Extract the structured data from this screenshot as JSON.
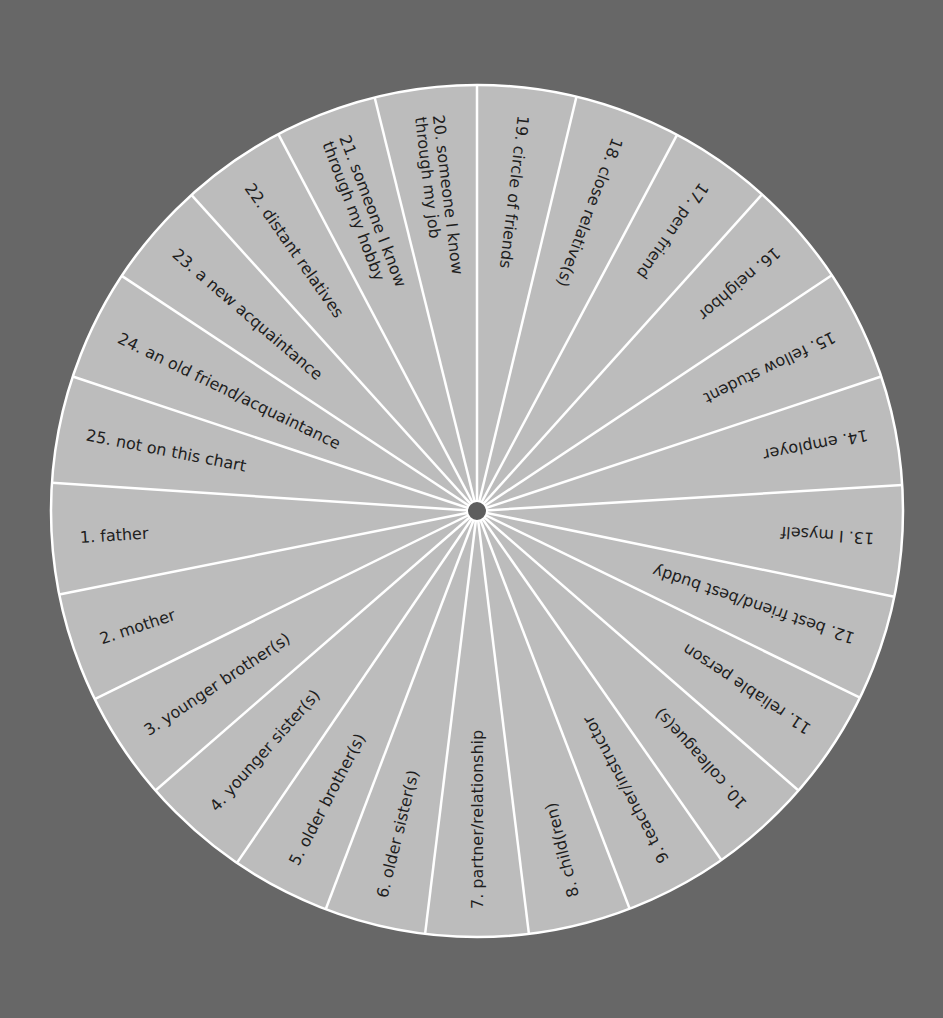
{
  "diagram": {
    "type": "circular-relationship-chart",
    "colors": {
      "background": "#676767",
      "wedge_fill": "#bcbcbc",
      "divider": "#ffffff",
      "hub": "#5e5e5e",
      "text": "#1e1e1e"
    },
    "center": [
      477,
      511
    ],
    "radius": 426,
    "hub_radius": 10,
    "boundaries_deg": [
      0,
      13.5,
      28,
      42,
      56.4,
      71.6,
      86.5,
      101.6,
      116,
      131,
      145,
      159,
      173,
      187,
      200.8,
      214.3,
      229,
      243.8,
      258.7,
      273.8,
      288.4,
      303.5,
      317.9,
      332.2,
      346.1
    ],
    "segments": [
      {
        "num": "19.",
        "label": "circle of friends",
        "line2": ""
      },
      {
        "num": "18.",
        "label": "close relative(s)",
        "line2": ""
      },
      {
        "num": "17.",
        "label": "pen friend",
        "line2": ""
      },
      {
        "num": "16.",
        "label": "neighbor",
        "line2": ""
      },
      {
        "num": "15.",
        "label": "fellow student",
        "line2": ""
      },
      {
        "num": "14.",
        "label": "employer",
        "line2": ""
      },
      {
        "num": "13.",
        "label": "I myself",
        "line2": ""
      },
      {
        "num": "12.",
        "label": "best friend/best buddy",
        "line2": ""
      },
      {
        "num": "11.",
        "label": "reliable person",
        "line2": ""
      },
      {
        "num": "10.",
        "label": "colleague(s)",
        "line2": ""
      },
      {
        "num": "9.",
        "label": "teacher/instructor",
        "line2": ""
      },
      {
        "num": "8.",
        "label": "child(ren)",
        "line2": ""
      },
      {
        "num": "7.",
        "label": "partner/relationship",
        "line2": ""
      },
      {
        "num": "6.",
        "label": "older sister(s)",
        "line2": ""
      },
      {
        "num": "5.",
        "label": "older brother(s)",
        "line2": ""
      },
      {
        "num": "4.",
        "label": "younger sister(s)",
        "line2": ""
      },
      {
        "num": "3.",
        "label": "younger brother(s)",
        "line2": ""
      },
      {
        "num": "2.",
        "label": "mother",
        "line2": ""
      },
      {
        "num": "1.",
        "label": "father",
        "line2": ""
      },
      {
        "num": "25.",
        "label": "not on this chart",
        "line2": ""
      },
      {
        "num": "24.",
        "label": "an old friend/acquaintance",
        "line2": ""
      },
      {
        "num": "23.",
        "label": "a new acquaintance",
        "line2": ""
      },
      {
        "num": "22.",
        "label": "distant relatives",
        "line2": ""
      },
      {
        "num": "21.",
        "label": "someone I know",
        "line2": "through my hobby"
      },
      {
        "num": "20.",
        "label": "someone I know",
        "line2": "through my job"
      }
    ]
  }
}
